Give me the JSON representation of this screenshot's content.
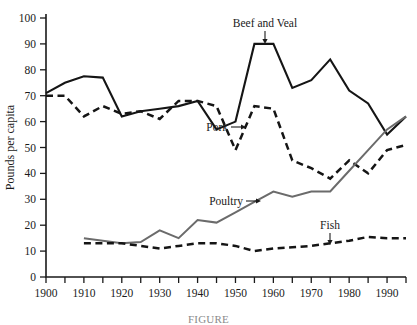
{
  "figure": {
    "ylabel": "Pounds per capita",
    "caption": "FIGURE",
    "annotations": [
      {
        "name": "beef-and-veal",
        "label": "Beef and Veal",
        "arrow": "down"
      },
      {
        "name": "pork",
        "label": "Pork",
        "arrow": "right"
      },
      {
        "name": "poultry",
        "label": "Poultry",
        "arrow": "right"
      },
      {
        "name": "fish",
        "label": "Fish",
        "arrow": "down"
      }
    ],
    "colors": {
      "beef": "#151515",
      "pork": "#151515",
      "poultry": "#6b6b6b",
      "fish": "#151515",
      "axis": "#1a1a1a"
    }
  },
  "chart_data": {
    "type": "line",
    "title": "",
    "xlabel": "",
    "ylabel": "Pounds per capita",
    "xlim": [
      1900,
      1995
    ],
    "ylim": [
      0,
      100
    ],
    "xticks": [
      1900,
      1905,
      1910,
      1915,
      1920,
      1925,
      1930,
      1935,
      1940,
      1945,
      1950,
      1955,
      1960,
      1965,
      1970,
      1975,
      1980,
      1985,
      1990,
      1995
    ],
    "xticklabels": [
      "1900",
      "",
      "1910",
      "",
      "1920",
      "",
      "1930",
      "",
      "1940",
      "",
      "1950",
      "",
      "1960",
      "",
      "1970",
      "",
      "1980",
      "",
      "1990",
      ""
    ],
    "yticks": [
      0,
      10,
      20,
      30,
      40,
      50,
      60,
      70,
      80,
      90,
      100
    ],
    "yticklabels": [
      "0",
      "10",
      "20",
      "30",
      "40",
      "50",
      "60",
      "70",
      "80",
      "90",
      "100"
    ],
    "grid": false,
    "legend": "inline-annotations",
    "series": [
      {
        "name": "Beef and Veal",
        "style": "solid",
        "color": "#151515",
        "x": [
          1900,
          1905,
          1910,
          1915,
          1920,
          1925,
          1930,
          1935,
          1940,
          1945,
          1950,
          1955,
          1960,
          1965,
          1970,
          1975,
          1980,
          1985,
          1990,
          1995
        ],
        "values": [
          71,
          75,
          77.5,
          77,
          62,
          64,
          65,
          66,
          68,
          57,
          60,
          90,
          90,
          73,
          76,
          84,
          72,
          67,
          55,
          62
        ]
      },
      {
        "name": "Pork",
        "style": "dashed",
        "color": "#151515",
        "x": [
          1900,
          1905,
          1910,
          1915,
          1920,
          1925,
          1930,
          1935,
          1940,
          1945,
          1950,
          1955,
          1960,
          1965,
          1970,
          1975,
          1980,
          1985,
          1990,
          1995
        ],
        "values": [
          70,
          70,
          62,
          66,
          63,
          64,
          61,
          68,
          68,
          66,
          49,
          66,
          65,
          45,
          42,
          38,
          45,
          40,
          49,
          51
        ]
      },
      {
        "name": "Poultry",
        "style": "solid",
        "color": "#6b6b6b",
        "x": [
          1910,
          1915,
          1920,
          1925,
          1930,
          1935,
          1940,
          1945,
          1950,
          1955,
          1960,
          1965,
          1970,
          1975,
          1980,
          1985,
          1990,
          1995
        ],
        "values": [
          15,
          14,
          13,
          13.5,
          18,
          15,
          22,
          21,
          25,
          29,
          33,
          31,
          33,
          33,
          41,
          49,
          57,
          62
        ]
      },
      {
        "name": "Fish",
        "style": "dashed",
        "color": "#151515",
        "x": [
          1910,
          1915,
          1920,
          1925,
          1930,
          1935,
          1940,
          1945,
          1950,
          1955,
          1960,
          1965,
          1970,
          1975,
          1980,
          1985,
          1990,
          1995
        ],
        "values": [
          13,
          13,
          13,
          12,
          11,
          12,
          13,
          13,
          12,
          10,
          11,
          11.5,
          12,
          13,
          14,
          15.5,
          15,
          15
        ]
      }
    ]
  }
}
